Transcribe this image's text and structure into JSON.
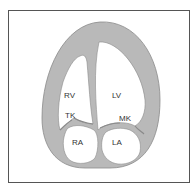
{
  "diagram": {
    "labels": {
      "rv": "RV",
      "lv": "LV",
      "tk": "TK",
      "mk": "MK",
      "ra": "RA",
      "la": "LA"
    },
    "colors": {
      "tissue": "#b9b9b9",
      "tissue_stroke": "#8a8a8a",
      "chamber": "#ffffff",
      "frame": "#555555"
    }
  }
}
